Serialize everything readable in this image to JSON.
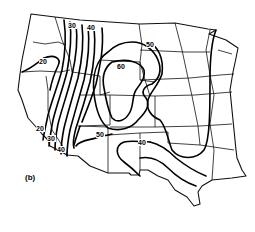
{
  "panel_label": "(b)",
  "map": {
    "region": "Western and Central United States",
    "contour_labels": [
      {
        "value": "30",
        "x": 72,
        "y": 28
      },
      {
        "value": "40",
        "x": 91,
        "y": 30
      },
      {
        "value": "20",
        "x": 43,
        "y": 64
      },
      {
        "value": "60",
        "x": 121,
        "y": 69
      },
      {
        "value": "50",
        "x": 150,
        "y": 47
      },
      {
        "value": "20",
        "x": 40,
        "y": 131
      },
      {
        "value": "30",
        "x": 51,
        "y": 141
      },
      {
        "value": "40",
        "x": 61,
        "y": 152
      },
      {
        "value": "50",
        "x": 100,
        "y": 137
      },
      {
        "value": "40",
        "x": 142,
        "y": 145
      }
    ],
    "colors": {
      "line": "#000000",
      "background": "#ffffff"
    }
  }
}
